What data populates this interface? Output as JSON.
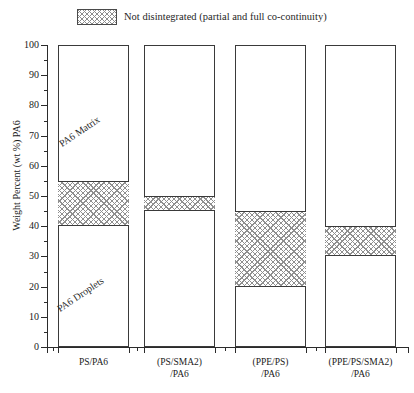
{
  "legend": {
    "label": "Not disintegrated (partial and full co-continuity)",
    "swatch_name": "crosshatch-pattern"
  },
  "axis": {
    "y_title": "Weight Percent (wt %) PA6",
    "y_ticks": [
      "0",
      "10",
      "20",
      "30",
      "40",
      "50",
      "60",
      "70",
      "80",
      "90",
      "100"
    ]
  },
  "annotations": {
    "matrix": "PA6 Matrix",
    "droplets": "PA6 Droplets"
  },
  "colors": {
    "axis": "#2b2b2b",
    "bar_outline": "#3a3a3a",
    "hatch": "#8f8f8f",
    "background": "#ffffff"
  },
  "chart_data": {
    "type": "bar",
    "title": "",
    "subtitle": "",
    "xlabel": "",
    "ylabel": "Weight Percent (wt %) PA6",
    "ylim": [
      0,
      100
    ],
    "xlim_note": "categorical, 4 blends",
    "grid": false,
    "legend_position": "top-center",
    "tick_step_major": 10,
    "tick_step_minor": 5,
    "categories": [
      "PS/PA6",
      "(PS/SMA2)\n/PA6",
      "(PPE/PS)\n/PA6",
      "(PPE/PS/SMA2)\n/PA6"
    ],
    "series": [
      {
        "name": "Not disintegrated (partial and full co-continuity)",
        "type": "range-band",
        "lower": [
          40,
          45,
          20,
          30
        ],
        "upper": [
          55,
          50,
          45,
          40
        ],
        "pattern": "crosshatch"
      },
      {
        "name": "PA6 Droplets",
        "type": "range-band",
        "lower": [
          0,
          0,
          0,
          0
        ],
        "upper": [
          40,
          45,
          20,
          30
        ],
        "pattern": "none"
      },
      {
        "name": "PA6 Matrix",
        "type": "range-band",
        "lower": [
          55,
          50,
          45,
          40
        ],
        "upper": [
          100,
          100,
          100,
          100
        ],
        "pattern": "none"
      }
    ],
    "bar_full_range": [
      0,
      100
    ],
    "annotations": [
      {
        "text": "PA6 Matrix",
        "category": "PS/PA6",
        "value_approx": 72,
        "rotation": -34
      },
      {
        "text": "PA6 Droplets",
        "category": "PS/PA6",
        "value_approx": 22,
        "rotation": -34
      }
    ]
  }
}
